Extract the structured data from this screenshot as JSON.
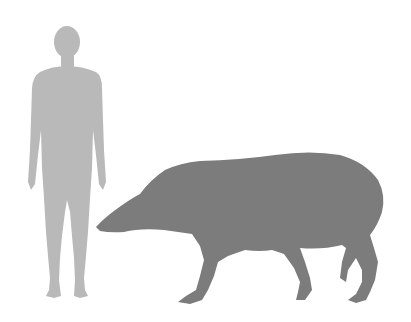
{
  "figure": {
    "type": "size-comparison-silhouette",
    "background": "#ffffff",
    "subjects": [
      {
        "name": "human",
        "color": "#b9b9b9"
      },
      {
        "name": "tapir",
        "color": "#7c7c7c"
      }
    ]
  }
}
